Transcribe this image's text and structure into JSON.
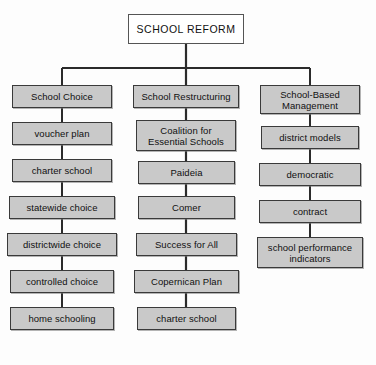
{
  "diagram": {
    "title": "SCHOOL REFORM",
    "type": "organizational-tree",
    "background_color": "#fdfdfd",
    "box_fill_color": "#c9c9c9",
    "box_border_color": "#3a3a3a",
    "root_fill_color": "#ffffff",
    "connector_color": "#2b2b2b",
    "root": {
      "label": "SCHOOL REFORM"
    },
    "branches": [
      {
        "heading": "School Choice",
        "items": [
          "voucher plan",
          "charter school",
          "statewide choice",
          "districtwide choice",
          "controlled choice",
          "home schooling"
        ]
      },
      {
        "heading": "School Restructuring",
        "items": [
          "Coalition for\nEssential Schools",
          "Paideia",
          "Comer",
          "Success for All",
          "Copernican Plan",
          "charter school"
        ]
      },
      {
        "heading": "School-Based\nManagement",
        "items": [
          "district models",
          "democratic",
          "contract",
          "school performance\nindicators"
        ]
      }
    ]
  }
}
